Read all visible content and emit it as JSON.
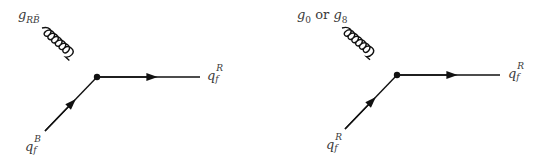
{
  "diagrams": [
    {
      "id": "left",
      "gluon_label": {
        "base": "g",
        "subscript": "RB̄"
      },
      "outgoing_quark": {
        "base": "q",
        "subscript": "f",
        "superscript": "R"
      },
      "incoming_quark": {
        "base": "q",
        "subscript": "f",
        "superscript": "B"
      }
    },
    {
      "id": "right",
      "gluon_label": {
        "part1_base": "g",
        "part1_sub": "0",
        "connector": "or",
        "part2_base": "g",
        "part2_sub": "8"
      },
      "outgoing_quark": {
        "base": "q",
        "subscript": "f",
        "superscript": "R"
      },
      "incoming_quark": {
        "base": "q",
        "subscript": "f",
        "superscript": "R"
      }
    }
  ],
  "colors": {
    "line": "#111111",
    "text": "#3a3a3a",
    "background": "#ffffff"
  }
}
